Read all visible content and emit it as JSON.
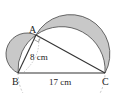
{
  "figure": {
    "points": {
      "A": {
        "label": "A",
        "x": 36,
        "y": 35
      },
      "B": {
        "label": "B",
        "x": 18,
        "y": 73
      },
      "C": {
        "label": "C",
        "x": 105,
        "y": 73
      }
    },
    "measurements": {
      "AB": "8 cm",
      "BC": "17 cm"
    },
    "colors": {
      "shade": "#c8c8c8",
      "line": "#333333",
      "dashed": "#999999"
    }
  }
}
